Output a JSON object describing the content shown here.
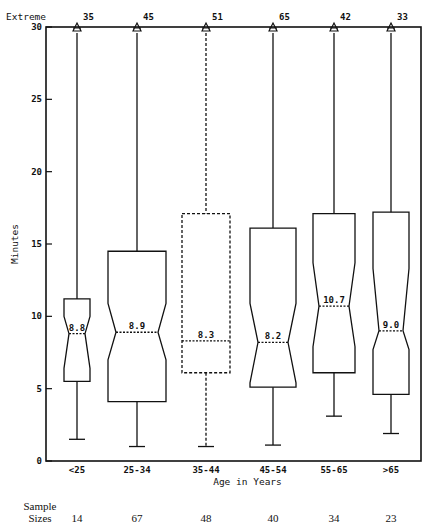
{
  "chart_data": {
    "type": "boxplot",
    "title": "",
    "xlabel": "Age in Years",
    "ylabel": "Minutes",
    "ylim": [
      0,
      30
    ],
    "yticks": [
      0,
      5,
      10,
      15,
      20,
      25,
      30
    ],
    "grid": false,
    "extreme_label": "Extreme",
    "categories": [
      "<25",
      "25-34",
      "35-44",
      "45-54",
      "55-65",
      ">65"
    ],
    "boxes": [
      {
        "category": "<25",
        "q1": 5.5,
        "median": 8.8,
        "q3": 11.2,
        "whisker_low": 1.5,
        "notch_low": 6.4,
        "notch_high": 10.0,
        "extreme_count": 35,
        "sample_size": 14,
        "median_label": "8.8",
        "style": "solid"
      },
      {
        "category": "25-34",
        "q1": 4.1,
        "median": 8.9,
        "q3": 14.5,
        "whisker_low": 1.0,
        "notch_low": 7.0,
        "notch_high": 10.9,
        "extreme_count": 45,
        "sample_size": 67,
        "median_label": "8.9",
        "style": "solid"
      },
      {
        "category": "35-44",
        "q1": 6.1,
        "median": 8.3,
        "q3": 17.1,
        "whisker_low": 1.0,
        "notch_low": null,
        "notch_high": null,
        "extreme_count": 51,
        "sample_size": 48,
        "median_label": "8.3",
        "style": "dashed"
      },
      {
        "category": "45-54",
        "q1": 5.1,
        "median": 8.2,
        "q3": 16.1,
        "whisker_low": 1.1,
        "notch_low": 5.4,
        "notch_high": 10.9,
        "extreme_count": 65,
        "sample_size": 40,
        "median_label": "8.2",
        "style": "solid"
      },
      {
        "category": "55-65",
        "q1": 6.1,
        "median": 10.7,
        "q3": 17.1,
        "whisker_low": 3.1,
        "notch_low": 7.9,
        "notch_high": 13.7,
        "extreme_count": 42,
        "sample_size": 34,
        "median_label": "10.7",
        "style": "solid"
      },
      {
        "category": ">65",
        "q1": 4.6,
        "median": 9.0,
        "q3": 17.2,
        "whisker_low": 1.9,
        "notch_low": 7.7,
        "notch_high": 13.3,
        "extreme_count": 33,
        "sample_size": 23,
        "median_label": "9.0",
        "style": "solid"
      }
    ],
    "sample_sizes_label": [
      "Sample",
      "Sizes"
    ],
    "sample_sizes": [
      14,
      67,
      48,
      40,
      34,
      23
    ]
  }
}
